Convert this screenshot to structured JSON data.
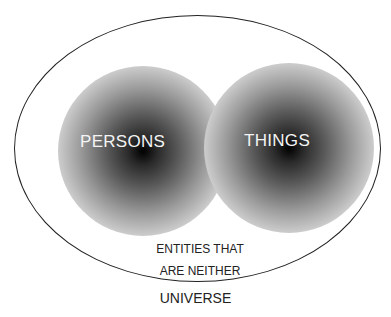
{
  "diagram": {
    "type": "venn",
    "sets": [
      {
        "label": "PERSONS",
        "style": "radial-gradient blob"
      },
      {
        "label": "THINGS",
        "style": "radial-gradient blob"
      }
    ],
    "remainder_label_line1": "ENTITIES THAT",
    "remainder_label_line2": "ARE NEITHER",
    "universe_label": "UNIVERSE"
  }
}
